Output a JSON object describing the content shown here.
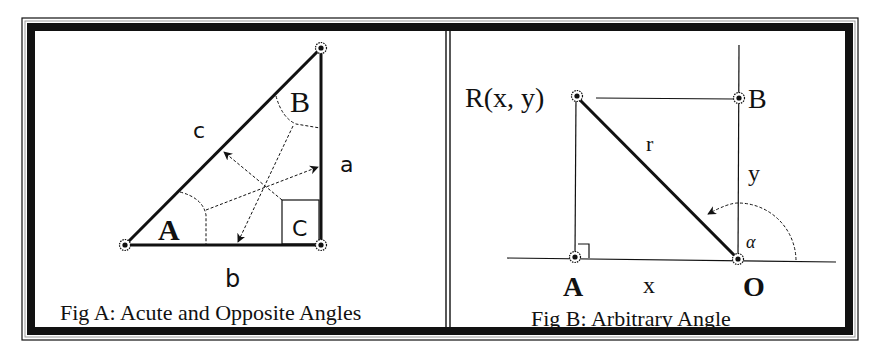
{
  "figure_a": {
    "caption": "Fig A: Acute and Opposite Angles",
    "side_labels": {
      "hypotenuse": "c",
      "vertical": "a",
      "base": "b"
    },
    "angle_labels": {
      "acute_bottom": "A",
      "acute_top": "B",
      "right": "C"
    }
  },
  "figure_b": {
    "caption": "Fig B: Arbitrary Angle",
    "point_labels": {
      "r_point": "R(x, y)",
      "b_point": "B",
      "a_point": "A",
      "origin": "O"
    },
    "segment_labels": {
      "radius": "r",
      "vertical": "y",
      "horizontal": "x"
    },
    "angle_label": "α"
  },
  "colors": {
    "ink": "#111111",
    "paper": "#ffffff",
    "frame_gray": "#9a9a9a"
  }
}
